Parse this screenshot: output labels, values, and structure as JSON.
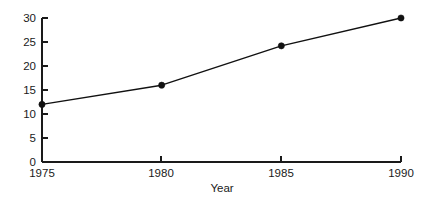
{
  "chart_data": {
    "type": "line",
    "title": "",
    "subtitle": "",
    "xlabel": "Year",
    "ylabel": "",
    "x": [
      1975,
      1980,
      1985,
      1990
    ],
    "categories": [
      "1975",
      "1980",
      "1985",
      "1990"
    ],
    "values": [
      12,
      16,
      24.2,
      30
    ],
    "series": [
      {
        "name": "",
        "values": [
          12,
          16,
          24.2,
          30
        ]
      }
    ],
    "xlim": [
      1975,
      1990
    ],
    "ylim": [
      0,
      30
    ],
    "x_ticks": [
      1975,
      1980,
      1985,
      1990
    ],
    "x_tick_labels": [
      "1975",
      "1980",
      "1985",
      "1990"
    ],
    "y_ticks": [
      0,
      5,
      10,
      15,
      20,
      25,
      30
    ],
    "y_tick_labels": [
      "0",
      "5",
      "10",
      "15",
      "20",
      "25",
      "30"
    ],
    "grid": false,
    "legend": null,
    "legend_position": "none",
    "annotations": [],
    "markers": "filled-circle",
    "line_color": "#111111",
    "marker_color": "#111111",
    "axis_color": "#1a1a1a",
    "background_color": "#ffffff",
    "tick_direction": "in"
  },
  "axis_labels": {
    "x_title": "Year",
    "y_title": ""
  }
}
